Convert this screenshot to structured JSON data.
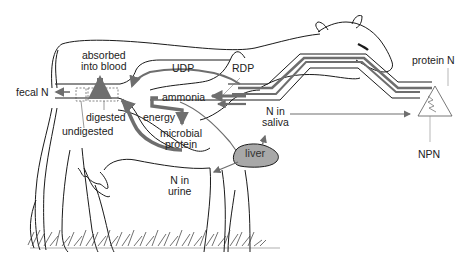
{
  "diagram": {
    "colors": {
      "outline": "#1a1a1a",
      "arrow": "#6e6e6e",
      "liver_fill": "#a8a8a8",
      "background": "#ffffff"
    },
    "labels": {
      "absorbed_line1": "absorbed",
      "absorbed_line2": "into blood",
      "udp": "UDP",
      "rdp": "RDP",
      "protein_n": "protein N",
      "fecal_n": "fecal N",
      "ammonia": "ammonia",
      "n_in_saliva_line1": "N in",
      "n_in_saliva_line2": "saliva",
      "digested": "digested",
      "energy": "energy",
      "undigested": "undigested",
      "microbial_line1": "microbial",
      "microbial_line2": "protein",
      "liver": "liver",
      "n_in_urine_line1": "N in",
      "n_in_urine_line2": "urine",
      "npn": "NPN"
    },
    "flows": [
      {
        "from": "feed (protein N, NPN)",
        "to": "rumen",
        "label": "RDP"
      },
      {
        "from": "feed",
        "to": "intestine",
        "label": "UDP"
      },
      {
        "from": "RDP",
        "to": "ammonia"
      },
      {
        "from": "ammonia",
        "to": "microbial protein",
        "via": "energy"
      },
      {
        "from": "microbial protein",
        "to": "intestine"
      },
      {
        "from": "intestine",
        "to": "blood",
        "label": "absorbed into blood"
      },
      {
        "from": "intestine",
        "to": "feces",
        "label": "fecal N"
      },
      {
        "from": "ammonia",
        "to": "liver"
      },
      {
        "from": "liver",
        "to": "saliva",
        "label": "N in saliva"
      },
      {
        "from": "liver",
        "to": "urine",
        "label": "N in urine"
      }
    ]
  }
}
